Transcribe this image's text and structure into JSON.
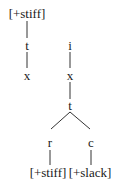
{
  "diagram": {
    "type": "feature-tree",
    "left_tree": {
      "root_feature": "[+stiff]",
      "nodes": [
        "t",
        "x"
      ]
    },
    "right_tree": {
      "nodes": [
        "i",
        "x",
        "t"
      ],
      "branches": [
        {
          "node": "r",
          "feature": "[+stiff]"
        },
        {
          "node": "c",
          "feature": "[+slack]"
        }
      ]
    }
  },
  "colors": {
    "text": "#1a1a1a",
    "line": "#333333",
    "background": "#ffffff"
  }
}
